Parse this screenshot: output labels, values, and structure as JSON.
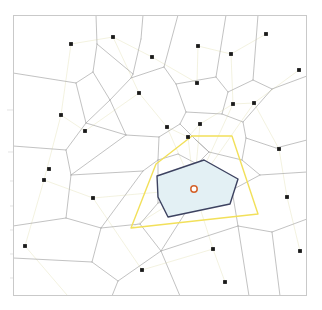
{
  "figure": {
    "title": "",
    "background_color": "#ffffff",
    "width": 322,
    "height": 310
  },
  "frame": {
    "name": "plot-frame",
    "x": 13,
    "y": 15,
    "width": 294,
    "height": 281,
    "border_color": "#c9c9c9",
    "border_width": 1,
    "fill_color": "#ffffff"
  },
  "chart_data": {
    "type": "scatter",
    "title": "",
    "xlabel": "",
    "ylabel": "",
    "xlim": [
      13,
      307
    ],
    "ylim": [
      15,
      296
    ],
    "grid": false,
    "legend": null,
    "annotations": [],
    "layers": {
      "voronoi_edges_label": "voronoi-cell-edges",
      "delaunay_edges_label": "delaunay-triangulation-edges",
      "seed_points_label": "seed-points",
      "highlight_cell_label": "natural-neighbor-cell",
      "neighbor_hull_label": "neighbor-hull-polygon",
      "query_point_label": "query-point"
    },
    "colors": {
      "voronoi_edge": "#a8a8a8",
      "delaunay_edge": "#f2f0dd",
      "seed_point": "#1a1a1a",
      "highlight_stroke": "#3d4260",
      "highlight_fill": "#e3f0f4",
      "hull_stroke": "#f2e05a",
      "query_point_stroke": "#d4622a",
      "query_point_fill": "#ffffff",
      "frame": "#c9c9c9",
      "tick": "#d9d9d9"
    },
    "seed_points": [
      [
        71,
        44
      ],
      [
        113,
        37
      ],
      [
        152,
        57
      ],
      [
        198,
        46
      ],
      [
        231,
        54
      ],
      [
        266,
        34
      ],
      [
        139,
        93
      ],
      [
        197,
        83
      ],
      [
        233,
        104
      ],
      [
        299,
        70
      ],
      [
        61,
        115
      ],
      [
        85,
        131
      ],
      [
        254,
        103
      ],
      [
        167,
        127
      ],
      [
        188,
        137
      ],
      [
        200,
        124
      ],
      [
        44,
        180
      ],
      [
        93,
        198
      ],
      [
        279,
        149
      ],
      [
        287,
        197
      ],
      [
        213,
        249
      ],
      [
        142,
        270
      ],
      [
        225,
        282
      ],
      [
        15,
        297
      ],
      [
        73,
        302
      ],
      [
        300,
        251
      ],
      [
        25,
        246
      ],
      [
        49,
        169
      ]
    ],
    "voronoi_edges": [
      [
        [
          96,
          15
        ],
        [
          97,
          44
        ]
      ],
      [
        [
          97,
          44
        ],
        [
          93,
          72
        ]
      ],
      [
        [
          93,
          72
        ],
        [
          76,
          83
        ]
      ],
      [
        [
          76,
          83
        ],
        [
          13,
          73
        ]
      ],
      [
        [
          93,
          72
        ],
        [
          110,
          100
        ]
      ],
      [
        [
          110,
          100
        ],
        [
          86,
          123
        ]
      ],
      [
        [
          86,
          123
        ],
        [
          76,
          83
        ]
      ],
      [
        [
          143,
          15
        ],
        [
          141,
          39
        ]
      ],
      [
        [
          141,
          39
        ],
        [
          133,
          74
        ]
      ],
      [
        [
          133,
          74
        ],
        [
          97,
          44
        ]
      ],
      [
        [
          133,
          74
        ],
        [
          131,
          78
        ]
      ],
      [
        [
          131,
          78
        ],
        [
          110,
          100
        ]
      ],
      [
        [
          131,
          78
        ],
        [
          164,
          67
        ]
      ],
      [
        [
          164,
          67
        ],
        [
          178,
          15
        ]
      ],
      [
        [
          164,
          67
        ],
        [
          176,
          84
        ]
      ],
      [
        [
          176,
          84
        ],
        [
          216,
          77
        ]
      ],
      [
        [
          216,
          77
        ],
        [
          226,
          15
        ]
      ],
      [
        [
          216,
          77
        ],
        [
          228,
          92
        ]
      ],
      [
        [
          228,
          92
        ],
        [
          253,
          80
        ]
      ],
      [
        [
          253,
          80
        ],
        [
          258,
          15
        ]
      ],
      [
        [
          253,
          80
        ],
        [
          272,
          89
        ]
      ],
      [
        [
          272,
          89
        ],
        [
          307,
          76
        ]
      ],
      [
        [
          228,
          92
        ],
        [
          222,
          114
        ]
      ],
      [
        [
          222,
          114
        ],
        [
          186,
          112
        ]
      ],
      [
        [
          186,
          112
        ],
        [
          176,
          84
        ]
      ],
      [
        [
          186,
          112
        ],
        [
          180,
          124
        ]
      ],
      [
        [
          222,
          114
        ],
        [
          243,
          122
        ]
      ],
      [
        [
          243,
          122
        ],
        [
          272,
          89
        ]
      ],
      [
        [
          243,
          122
        ],
        [
          246,
          138
        ]
      ],
      [
        [
          246,
          138
        ],
        [
          276,
          148
        ]
      ],
      [
        [
          276,
          148
        ],
        [
          307,
          140
        ]
      ],
      [
        [
          110,
          100
        ],
        [
          126,
          135
        ]
      ],
      [
        [
          126,
          135
        ],
        [
          86,
          123
        ]
      ],
      [
        [
          86,
          123
        ],
        [
          66,
          150
        ]
      ],
      [
        [
          66,
          150
        ],
        [
          13,
          146
        ]
      ],
      [
        [
          66,
          150
        ],
        [
          71,
          175
        ]
      ],
      [
        [
          71,
          175
        ],
        [
          126,
          135
        ]
      ],
      [
        [
          126,
          135
        ],
        [
          159,
          137
        ]
      ],
      [
        [
          159,
          137
        ],
        [
          180,
          124
        ]
      ],
      [
        [
          159,
          137
        ],
        [
          158,
          160
        ]
      ],
      [
        [
          158,
          160
        ],
        [
          143,
          171
        ]
      ],
      [
        [
          143,
          171
        ],
        [
          71,
          175
        ]
      ],
      [
        [
          71,
          175
        ],
        [
          66,
          218
        ]
      ],
      [
        [
          66,
          218
        ],
        [
          13,
          226
        ]
      ],
      [
        [
          66,
          218
        ],
        [
          101,
          228
        ]
      ],
      [
        [
          101,
          228
        ],
        [
          143,
          171
        ]
      ],
      [
        [
          158,
          160
        ],
        [
          178,
          154
        ]
      ],
      [
        [
          178,
          154
        ],
        [
          197,
          164
        ]
      ],
      [
        [
          197,
          164
        ],
        [
          209,
          152
        ]
      ],
      [
        [
          209,
          152
        ],
        [
          196,
          140
        ]
      ],
      [
        [
          196,
          140
        ],
        [
          180,
          124
        ]
      ],
      [
        [
          196,
          140
        ],
        [
          209,
          152
        ]
      ],
      [
        [
          209,
          152
        ],
        [
          242,
          160
        ]
      ],
      [
        [
          242,
          160
        ],
        [
          246,
          138
        ]
      ],
      [
        [
          242,
          160
        ],
        [
          260,
          175
        ]
      ],
      [
        [
          260,
          175
        ],
        [
          307,
          172
        ]
      ],
      [
        [
          197,
          164
        ],
        [
          196,
          196
        ]
      ],
      [
        [
          196,
          196
        ],
        [
          158,
          203
        ]
      ],
      [
        [
          158,
          203
        ],
        [
          158,
          160
        ]
      ],
      [
        [
          196,
          196
        ],
        [
          232,
          190
        ]
      ],
      [
        [
          232,
          190
        ],
        [
          260,
          175
        ]
      ],
      [
        [
          232,
          190
        ],
        [
          238,
          226
        ]
      ],
      [
        [
          238,
          226
        ],
        [
          272,
          232
        ]
      ],
      [
        [
          272,
          232
        ],
        [
          307,
          219
        ]
      ],
      [
        [
          158,
          203
        ],
        [
          140,
          224
        ]
      ],
      [
        [
          140,
          224
        ],
        [
          101,
          228
        ]
      ],
      [
        [
          140,
          224
        ],
        [
          161,
          251
        ]
      ],
      [
        [
          161,
          251
        ],
        [
          196,
          196
        ]
      ],
      [
        [
          161,
          251
        ],
        [
          238,
          226
        ]
      ],
      [
        [
          101,
          228
        ],
        [
          92,
          262
        ]
      ],
      [
        [
          92,
          262
        ],
        [
          13,
          258
        ]
      ],
      [
        [
          92,
          262
        ],
        [
          118,
          281
        ]
      ],
      [
        [
          118,
          281
        ],
        [
          161,
          251
        ]
      ],
      [
        [
          118,
          281
        ],
        [
          112,
          296
        ]
      ],
      [
        [
          161,
          251
        ],
        [
          180,
          296
        ]
      ],
      [
        [
          238,
          226
        ],
        [
          249,
          296
        ]
      ],
      [
        [
          272,
          232
        ],
        [
          280,
          296
        ]
      ]
    ],
    "delaunay_edges": [
      [
        [
          194,
          189
        ],
        [
          167,
          127
        ]
      ],
      [
        [
          194,
          189
        ],
        [
          188,
          137
        ]
      ],
      [
        [
          194,
          189
        ],
        [
          200,
          124
        ]
      ],
      [
        [
          194,
          189
        ],
        [
          233,
          104
        ]
      ],
      [
        [
          194,
          189
        ],
        [
          254,
          103
        ]
      ],
      [
        [
          194,
          189
        ],
        [
          131,
          228
        ]
      ],
      [
        [
          194,
          189
        ],
        [
          93,
          198
        ]
      ],
      [
        [
          194,
          189
        ],
        [
          213,
          249
        ]
      ],
      [
        [
          167,
          127
        ],
        [
          188,
          137
        ]
      ],
      [
        [
          188,
          137
        ],
        [
          200,
          124
        ]
      ],
      [
        [
          200,
          124
        ],
        [
          233,
          104
        ]
      ],
      [
        [
          93,
          198
        ],
        [
          44,
          180
        ]
      ],
      [
        [
          44,
          180
        ],
        [
          61,
          115
        ]
      ],
      [
        [
          61,
          115
        ],
        [
          85,
          131
        ]
      ],
      [
        [
          85,
          131
        ],
        [
          139,
          93
        ]
      ],
      [
        [
          139,
          93
        ],
        [
          167,
          127
        ]
      ],
      [
        [
          139,
          93
        ],
        [
          113,
          37
        ]
      ],
      [
        [
          113,
          37
        ],
        [
          152,
          57
        ]
      ],
      [
        [
          152,
          57
        ],
        [
          197,
          83
        ]
      ],
      [
        [
          197,
          83
        ],
        [
          198,
          46
        ]
      ],
      [
        [
          198,
          46
        ],
        [
          231,
          54
        ]
      ],
      [
        [
          231,
          54
        ],
        [
          233,
          104
        ]
      ],
      [
        [
          233,
          104
        ],
        [
          254,
          103
        ]
      ],
      [
        [
          254,
          103
        ],
        [
          279,
          149
        ]
      ],
      [
        [
          279,
          149
        ],
        [
          287,
          197
        ]
      ],
      [
        [
          93,
          198
        ],
        [
          142,
          270
        ]
      ],
      [
        [
          142,
          270
        ],
        [
          213,
          249
        ]
      ],
      [
        [
          213,
          249
        ],
        [
          225,
          282
        ]
      ],
      [
        [
          71,
          44
        ],
        [
          113,
          37
        ]
      ],
      [
        [
          71,
          44
        ],
        [
          61,
          115
        ]
      ],
      [
        [
          25,
          246
        ],
        [
          44,
          180
        ]
      ],
      [
        [
          25,
          246
        ],
        [
          73,
          302
        ]
      ],
      [
        [
          266,
          34
        ],
        [
          231,
          54
        ]
      ],
      [
        [
          299,
          70
        ],
        [
          254,
          103
        ]
      ],
      [
        [
          300,
          251
        ],
        [
          287,
          197
        ]
      ]
    ],
    "highlight_cell": {
      "label": "natural-neighbor-cell",
      "vertices": [
        [
          204,
          160
        ],
        [
          238,
          179
        ],
        [
          230,
          204
        ],
        [
          168,
          217
        ],
        [
          158,
          197
        ],
        [
          157,
          176
        ]
      ],
      "stroke": "#3d4260",
      "fill": "#e3f0f4",
      "stroke_width": 1.4
    },
    "neighbor_hull": {
      "label": "neighbor-hull-polygon",
      "vertices": [
        [
          192,
          136
        ],
        [
          232,
          136
        ],
        [
          258,
          214
        ],
        [
          131,
          228
        ],
        [
          156,
          164
        ]
      ],
      "stroke": "#f2e05a",
      "fill": "none",
      "stroke_width": 1.4
    },
    "query_point": {
      "label": "query-point",
      "x": 194,
      "y": 189,
      "radius": 3.2,
      "stroke": "#d4622a",
      "fill": "#ffffff"
    },
    "axis_ticks_left": [
      {
        "y": 110,
        "width": 6
      },
      {
        "y": 152,
        "width": 5
      },
      {
        "y": 181,
        "width": 3
      },
      {
        "y": 206,
        "width": 3
      },
      {
        "y": 230,
        "width": 3
      },
      {
        "y": 254,
        "width": 3
      },
      {
        "y": 278,
        "width": 3
      }
    ]
  }
}
